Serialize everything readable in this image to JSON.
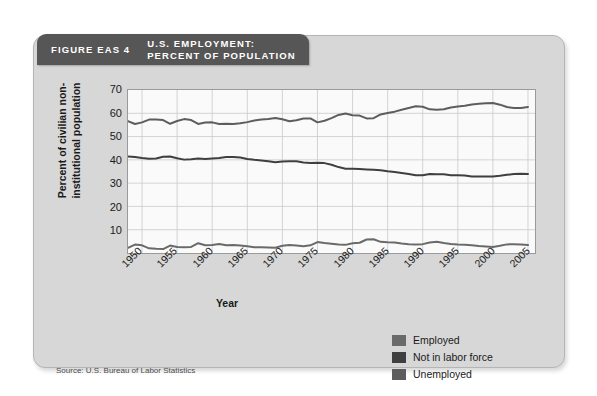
{
  "figure": {
    "number": "FIGURE EAS 4",
    "title_line1": "U.S. EMPLOYMENT:",
    "title_line2": "PERCENT OF POPULATION",
    "source": "Source: U.S. Bureau of Labor Statistics",
    "header_color": "#565656",
    "card_color": "#d7d7d7"
  },
  "chart_data": {
    "type": "line",
    "title": "U.S. EMPLOYMENT: PERCENT OF POPULATION",
    "xlabel": "Year",
    "ylabel": "Percent of civilian non-institutional population",
    "xlim": [
      1948,
      2006
    ],
    "ylim": [
      0,
      70
    ],
    "yticks": [
      10,
      20,
      30,
      40,
      50,
      60,
      70
    ],
    "xticks": [
      1950,
      1955,
      1960,
      1965,
      1970,
      1975,
      1980,
      1985,
      1990,
      1995,
      2000,
      2005
    ],
    "grid": true,
    "legend_position": "bottom-right",
    "x": [
      1948,
      1949,
      1950,
      1951,
      1952,
      1953,
      1954,
      1955,
      1956,
      1957,
      1958,
      1959,
      1960,
      1961,
      1962,
      1963,
      1964,
      1965,
      1966,
      1967,
      1968,
      1969,
      1970,
      1971,
      1972,
      1973,
      1974,
      1975,
      1976,
      1977,
      1978,
      1979,
      1980,
      1981,
      1982,
      1983,
      1984,
      1985,
      1986,
      1987,
      1988,
      1989,
      1990,
      1991,
      1992,
      1993,
      1994,
      1995,
      1996,
      1997,
      1998,
      1999,
      2000,
      2001,
      2002,
      2003,
      2004,
      2005
    ],
    "series": [
      {
        "name": "Employed",
        "color": "#5d5d5d",
        "values": [
          56.6,
          55.4,
          56.1,
          57.3,
          57.3,
          57.1,
          55.5,
          56.7,
          57.5,
          57.1,
          55.4,
          56.0,
          56.1,
          55.4,
          55.5,
          55.4,
          55.7,
          56.2,
          56.9,
          57.3,
          57.5,
          58.0,
          57.4,
          56.6,
          57.0,
          57.8,
          57.8,
          56.1,
          56.8,
          57.9,
          59.3,
          59.9,
          59.2,
          59.0,
          57.8,
          57.9,
          59.5,
          60.1,
          60.7,
          61.5,
          62.3,
          63.0,
          62.8,
          61.7,
          61.5,
          61.7,
          62.5,
          62.9,
          63.2,
          63.8,
          64.1,
          64.3,
          64.4,
          63.7,
          62.7,
          62.3,
          62.3,
          62.7
        ]
      },
      {
        "name": "Not in labor force",
        "color": "#3f3f3f",
        "values": [
          41.4,
          41.2,
          40.8,
          40.5,
          40.6,
          41.3,
          41.4,
          40.7,
          40.1,
          40.3,
          40.6,
          40.4,
          40.6,
          40.8,
          41.2,
          41.2,
          41.0,
          40.4,
          40.0,
          39.7,
          39.4,
          39.0,
          39.3,
          39.4,
          39.4,
          38.9,
          38.6,
          38.8,
          38.6,
          37.9,
          36.9,
          36.2,
          36.2,
          36.1,
          35.9,
          35.7,
          35.5,
          35.1,
          34.8,
          34.4,
          33.9,
          33.4,
          33.4,
          33.9,
          33.8,
          33.8,
          33.4,
          33.4,
          33.3,
          32.9,
          32.9,
          32.9,
          32.9,
          33.2,
          33.6,
          33.9,
          34.0,
          33.9
        ]
      },
      {
        "name": "Unemployed",
        "color": "#6a6a6a",
        "values": [
          2.2,
          3.6,
          3.3,
          2.0,
          1.8,
          1.7,
          3.2,
          2.6,
          2.5,
          2.6,
          4.2,
          3.3,
          3.4,
          3.9,
          3.3,
          3.4,
          3.2,
          2.9,
          2.5,
          2.5,
          2.4,
          2.3,
          3.1,
          3.4,
          3.2,
          2.9,
          3.3,
          4.7,
          4.3,
          4.0,
          3.6,
          3.5,
          4.2,
          4.4,
          5.8,
          5.9,
          4.8,
          4.6,
          4.5,
          4.1,
          3.8,
          3.7,
          3.8,
          4.5,
          4.8,
          4.3,
          3.9,
          3.6,
          3.5,
          3.3,
          3.0,
          2.8,
          2.6,
          3.1,
          3.7,
          3.8,
          3.6,
          3.4
        ]
      }
    ]
  },
  "axes": {
    "y_ticks": [
      {
        "value": 70,
        "label": "70"
      },
      {
        "value": 60,
        "label": "60"
      },
      {
        "value": 50,
        "label": "50"
      },
      {
        "value": 40,
        "label": "40"
      },
      {
        "value": 30,
        "label": "30"
      },
      {
        "value": 20,
        "label": "20"
      },
      {
        "value": 10,
        "label": "10"
      }
    ],
    "x_ticks": [
      {
        "value": 1950,
        "label": "1950"
      },
      {
        "value": 1955,
        "label": "1955"
      },
      {
        "value": 1960,
        "label": "1960"
      },
      {
        "value": 1965,
        "label": "1965"
      },
      {
        "value": 1970,
        "label": "1970"
      },
      {
        "value": 1975,
        "label": "1975"
      },
      {
        "value": 1980,
        "label": "1980"
      },
      {
        "value": 1985,
        "label": "1985"
      },
      {
        "value": 1990,
        "label": "1990"
      },
      {
        "value": 1995,
        "label": "1995"
      },
      {
        "value": 2000,
        "label": "2000"
      },
      {
        "value": 2005,
        "label": "2005"
      }
    ],
    "y_title": "Percent of civilian non-institutional population",
    "x_title": "Year"
  },
  "legend": [
    {
      "label": "Employed",
      "color": "#6a6a6a"
    },
    {
      "label": "Not in labor force",
      "color": "#3f3f3f"
    },
    {
      "label": "Unemployed",
      "color": "#5d5d5d"
    }
  ]
}
